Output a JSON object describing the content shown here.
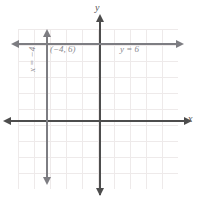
{
  "figure": {
    "type": "coordinate-plane-graph",
    "background_color": "#ffffff",
    "grid_color": "#eeeaea",
    "axis_color": "#4d4d4d",
    "line_color": "#7d7d82",
    "label_color": "#8a8a8f"
  },
  "axes": {
    "x_label": "x",
    "y_label": "y",
    "x_axis_name": "horizontal-axis",
    "y_axis_name": "vertical-axis",
    "arrow_left_icon": "arrow-left-icon",
    "arrow_right_icon": "arrow-right-icon",
    "arrow_up_icon": "arrow-up-icon",
    "arrow_down_icon": "arrow-down-icon"
  },
  "labels": {
    "point": "(−4, 6)",
    "horizontal_line": "y = 6",
    "vertical_line": "x = −4"
  },
  "chart_data": {
    "type": "line",
    "title": "",
    "xlabel": "x",
    "ylabel": "y",
    "xlim": [
      -10,
      10
    ],
    "ylim": [
      -10,
      10
    ],
    "grid": true,
    "grid_spacing": 2,
    "legend": "none",
    "series": [
      {
        "name": "y = 6",
        "orientation": "horizontal",
        "equation": "y = 6",
        "constant": 6,
        "x": [
          -10,
          10
        ],
        "values": [
          6,
          6
        ],
        "arrows": [
          "left",
          "right"
        ],
        "color": "#7d7d82"
      },
      {
        "name": "x = -4",
        "orientation": "vertical",
        "equation": "x = -4",
        "constant": -4,
        "x": [
          -4,
          -4
        ],
        "values": [
          -9,
          9
        ],
        "arrows": [
          "up",
          "down"
        ],
        "color": "#7d7d82"
      }
    ],
    "annotations": [
      {
        "text": "(−4, 6)",
        "x": -4,
        "y": 6,
        "kind": "intersection-point-label"
      },
      {
        "text": "y = 6",
        "x": 2,
        "y": 6,
        "kind": "line-equation-label"
      },
      {
        "text": "x = −4",
        "x": -4,
        "y": 0,
        "kind": "line-equation-label",
        "rotation": -90
      }
    ]
  }
}
